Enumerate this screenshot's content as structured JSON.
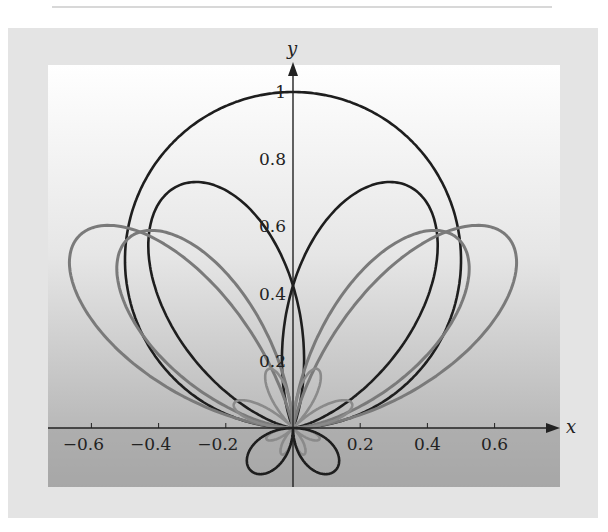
{
  "chart_data": {
    "type": "line",
    "subtype": "polar-parametric",
    "title": "",
    "xlabel": "x",
    "ylabel": "y",
    "xlim": [
      -0.78,
      0.78
    ],
    "ylim": [
      -0.18,
      1.08
    ],
    "grid": false,
    "legend": null,
    "x_ticks": [
      -0.6,
      -0.4,
      -0.2,
      0.2,
      0.4,
      0.6
    ],
    "x_tick_labels": [
      "−0.6",
      "−0.4",
      "−0.2",
      "0.2",
      "0.4",
      "0.6"
    ],
    "y_ticks": [
      0.2,
      0.4,
      0.6,
      0.8,
      1
    ],
    "y_tick_labels": [
      "0.2",
      "0.4",
      "0.6",
      "0.8",
      "1"
    ],
    "series": [
      {
        "name": "circle r = sinθ",
        "color": "#1e1e1e",
        "width": 2.6,
        "kind": "sinpow",
        "n": 1,
        "tilt": 0
      },
      {
        "name": "left lobe (black)",
        "color": "#1e1e1e",
        "width": 2.6,
        "kind": "lobe",
        "peak": 0.77,
        "angle_deg": 122,
        "spread": 0.62
      },
      {
        "name": "right lobe (black)",
        "color": "#1e1e1e",
        "width": 2.6,
        "kind": "lobe",
        "peak": 0.77,
        "angle_deg": 58,
        "spread": 0.62
      },
      {
        "name": "left lobe gray outer",
        "color": "#7a7a7a",
        "width": 3,
        "kind": "lobe",
        "peak": 0.72,
        "angle_deg": 150,
        "spread": 0.55
      },
      {
        "name": "right lobe gray outer",
        "color": "#7a7a7a",
        "width": 3,
        "kind": "lobe",
        "peak": 0.72,
        "angle_deg": 30,
        "spread": 0.55
      },
      {
        "name": "left lobe gray inner",
        "color": "#7a7a7a",
        "width": 3,
        "kind": "lobe",
        "peak": 0.68,
        "angle_deg": 140,
        "spread": 0.55
      },
      {
        "name": "right lobe gray inner",
        "color": "#7a7a7a",
        "width": 3,
        "kind": "lobe",
        "peak": 0.68,
        "angle_deg": 40,
        "spread": 0.55
      },
      {
        "name": "small rose petals (gray)",
        "color": "#8a8a8a",
        "width": 2.6,
        "kind": "rose",
        "amp": 0.19,
        "k": 4
      },
      {
        "name": "lower petals (black)",
        "color": "#1e1e1e",
        "width": 2.6,
        "kind": "lower",
        "amp": 0.17
      }
    ],
    "annotations": []
  },
  "axes": {
    "x_name": "x",
    "y_name": "y"
  }
}
